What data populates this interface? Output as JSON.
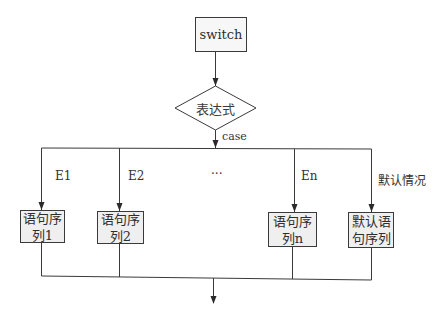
{
  "diagram": {
    "type": "flowchart",
    "start": {
      "label": "switch"
    },
    "decision": {
      "label": "表达式"
    },
    "decision_edge_label": "case",
    "ellipsis": "···",
    "branches": [
      {
        "condition": "E1",
        "box_line1": "语句序",
        "box_line2": "列1"
      },
      {
        "condition": "E2",
        "box_line1": "语句序",
        "box_line2": "列2"
      },
      {
        "condition": "En",
        "box_line1": "语句序",
        "box_line2": "列n"
      },
      {
        "condition": "默认情况",
        "box_line1": "默认语",
        "box_line2": "句序列"
      }
    ],
    "colors": {
      "line": "#3a3a3a",
      "box_fill": "#efefef",
      "background": "#ffffff"
    }
  }
}
